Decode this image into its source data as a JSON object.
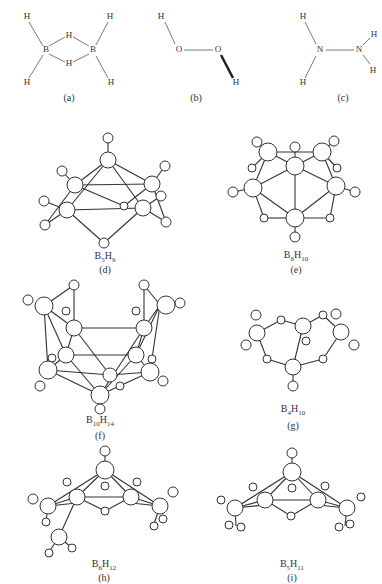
{
  "figure": {
    "panels": [
      {
        "id": "a",
        "label": "(a)",
        "molecule": "B2H6",
        "atoms": [
          "H",
          "H",
          "B",
          "H",
          "B",
          "H",
          "H",
          "H"
        ]
      },
      {
        "id": "b",
        "label": "(b)",
        "molecule": "H2O2",
        "atoms": [
          "H",
          "O",
          "O",
          "H"
        ]
      },
      {
        "id": "c",
        "label": "(c)",
        "molecule": "N2H4",
        "atoms": [
          "H",
          "N",
          "N",
          "H",
          "H",
          "H"
        ]
      },
      {
        "id": "d",
        "label": "(d)",
        "formula": {
          "b": "B",
          "bn": "5",
          "h": "H",
          "hn": "9"
        }
      },
      {
        "id": "e",
        "label": "(e)",
        "formula": {
          "b": "B",
          "bn": "6",
          "h": "H",
          "hn": "10"
        }
      },
      {
        "id": "f",
        "label": "(f)",
        "formula": {
          "b": "B",
          "bn": "10",
          "h": "H",
          "hn": "14"
        }
      },
      {
        "id": "g",
        "label": "(g)",
        "formula": {
          "b": "B",
          "bn": "4",
          "h": "H",
          "hn": "10"
        }
      },
      {
        "id": "h",
        "label": "(h)",
        "formula": {
          "b": "B",
          "bn": "6",
          "h": "H",
          "hn": "12"
        }
      },
      {
        "id": "i",
        "label": "(i)",
        "formula": {
          "b": "B",
          "bn": "5",
          "h": "H",
          "hn": "11"
        }
      }
    ],
    "atom_symbols": {
      "H": "H",
      "B": "B",
      "O": "O",
      "N": "N"
    }
  }
}
